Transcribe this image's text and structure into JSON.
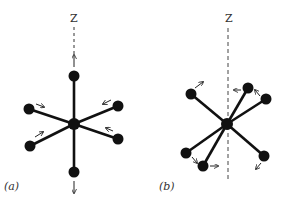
{
  "figure": {
    "colors": {
      "atom": "#111111",
      "bond": "#111111",
      "axis": "#333333",
      "arrow": "#222222",
      "background": "#ffffff"
    }
  },
  "panels": [
    {
      "id": "a",
      "label": "(a)",
      "axis_label": "Z",
      "center": [
        74,
        124
      ],
      "atoms": [
        {
          "name": "top",
          "pos": [
            74,
            76
          ],
          "arrow": {
            "from": [
              74,
              67
            ],
            "to": [
              74,
              55
            ]
          }
        },
        {
          "name": "bottom",
          "pos": [
            74,
            172
          ],
          "arrow": {
            "from": [
              74,
              181
            ],
            "to": [
              74,
              193
            ]
          }
        },
        {
          "name": "upper-left",
          "pos": [
            29,
            109
          ],
          "arrow": {
            "from": [
              36,
              104
            ],
            "to": [
              44,
              107
            ]
          }
        },
        {
          "name": "upper-right",
          "pos": [
            118,
            106
          ],
          "arrow": {
            "from": [
              111,
              100
            ],
            "to": [
              103,
              104
            ]
          }
        },
        {
          "name": "lower-left",
          "pos": [
            30,
            146
          ],
          "arrow": {
            "from": [
              35,
              137
            ],
            "to": [
              43,
              132
            ]
          }
        },
        {
          "name": "lower-right",
          "pos": [
            118,
            139
          ],
          "arrow": {
            "from": [
              113,
              131
            ],
            "to": [
              106,
              128
            ]
          }
        }
      ]
    },
    {
      "id": "b",
      "label": "(b)",
      "axis_label": "Z",
      "center": [
        227,
        124
      ],
      "atoms": [
        {
          "name": "upper-left",
          "pos": [
            191,
            94
          ],
          "arrow": {
            "from": [
              195,
              88
            ],
            "to": [
              203,
              82
            ]
          }
        },
        {
          "name": "upper-right-front",
          "pos": [
            248,
            88
          ],
          "arrow": {
            "from": [
              241,
              90
            ],
            "to": [
              234,
              90
            ]
          }
        },
        {
          "name": "upper-right-back",
          "pos": [
            266,
            99
          ],
          "arrow": {
            "from": [
              260,
              96
            ],
            "to": [
              255,
              90
            ]
          }
        },
        {
          "name": "lower-left-back",
          "pos": [
            186,
            153
          ],
          "arrow": {
            "from": [
              192,
              157
            ],
            "to": [
              197,
              163
            ]
          }
        },
        {
          "name": "lower-left-front",
          "pos": [
            203,
            166
          ],
          "arrow": {
            "from": [
              210,
              166
            ],
            "to": [
              218,
              166
            ]
          }
        },
        {
          "name": "lower-right",
          "pos": [
            264,
            156
          ],
          "arrow": {
            "from": [
              261,
              163
            ],
            "to": [
              256,
              169
            ]
          }
        }
      ]
    }
  ]
}
